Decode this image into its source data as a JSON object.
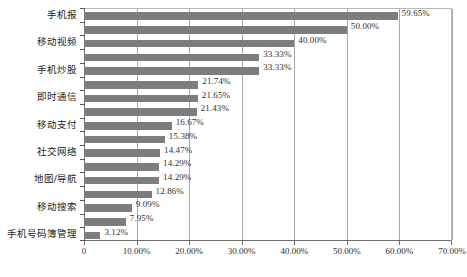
{
  "chart_data": {
    "type": "bar",
    "orientation": "horizontal",
    "title": "",
    "xlabel": "",
    "ylabel": "",
    "xlim": [
      0,
      0.7
    ],
    "grid": true,
    "legend": false,
    "xticklabels": [
      "0",
      "10.00%",
      "20.00%",
      "30.00%",
      "40.00%",
      "50.00%",
      "60.00%",
      "70.00%"
    ],
    "xtickvalues": [
      0,
      0.1,
      0.2,
      0.3,
      0.4,
      0.5,
      0.6,
      0.7
    ],
    "categories": [
      "手机报",
      "移动视频",
      "手机炒股",
      "即时通信",
      "移动支付",
      "社交网络",
      "地图/导航",
      "移动搜索",
      "手机号码簿管理"
    ],
    "bars": [
      {
        "value": 59.65,
        "label": "59.65%"
      },
      {
        "value": 50.0,
        "label": "50.00%"
      },
      {
        "value": 40.0,
        "label": "40.00%"
      },
      {
        "value": 33.33,
        "label": "33.33%"
      },
      {
        "value": 33.33,
        "label": "33.33%"
      },
      {
        "value": 21.74,
        "label": "21.74%"
      },
      {
        "value": 21.65,
        "label": "21.65%"
      },
      {
        "value": 21.43,
        "label": "21.43%"
      },
      {
        "value": 16.67,
        "label": "16.67%"
      },
      {
        "value": 15.38,
        "label": "15.38%"
      },
      {
        "value": 14.47,
        "label": "14.47%"
      },
      {
        "value": 14.29,
        "label": "14.29%"
      },
      {
        "value": 14.29,
        "label": "14.29%"
      },
      {
        "value": 12.86,
        "label": "12.86%"
      },
      {
        "value": 9.09,
        "label": "9.09%"
      },
      {
        "value": 7.95,
        "label": "7.95%"
      },
      {
        "value": 3.12,
        "label": "3.12%"
      }
    ],
    "bar_color": "#7d7d7d",
    "grid_color": "#a9a9a9",
    "axis_color": "#6e6e6e",
    "plot_background": "#ffffff"
  },
  "caption": ""
}
